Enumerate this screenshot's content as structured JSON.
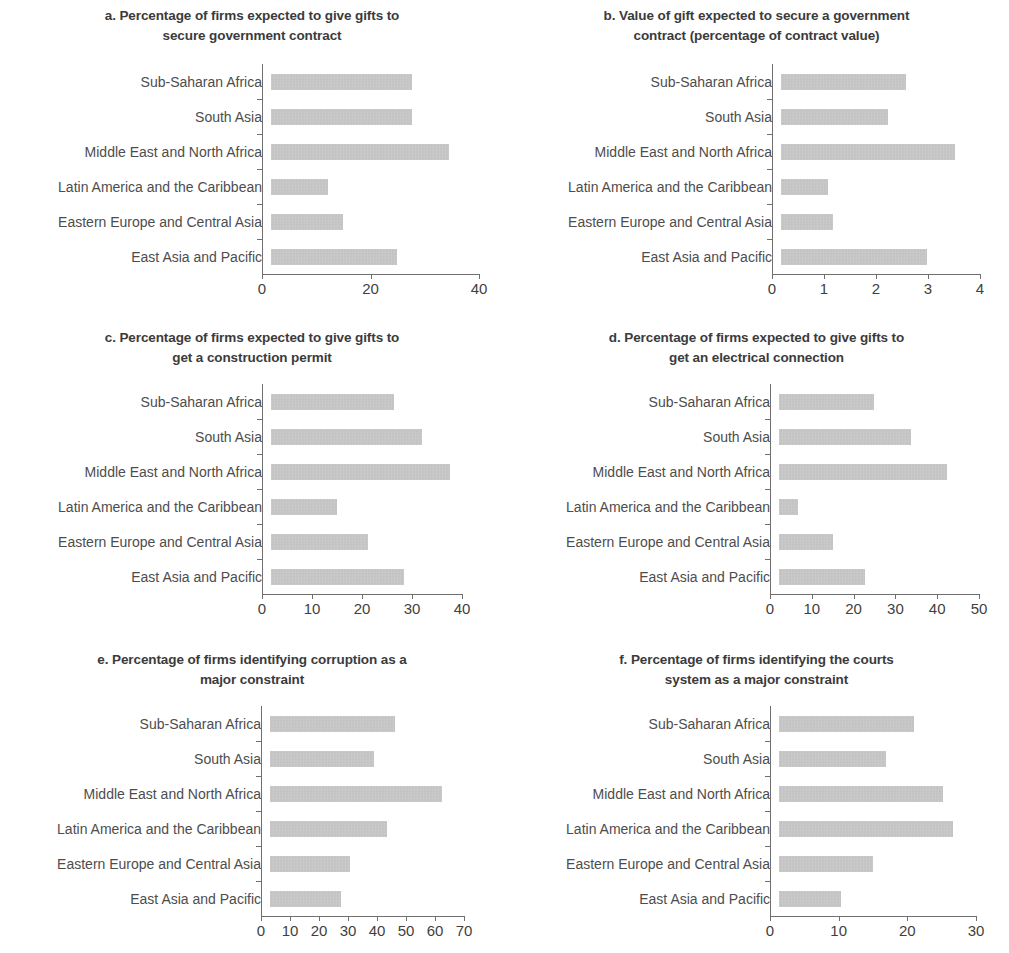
{
  "figure": {
    "categories": [
      "Sub-Saharan Africa",
      "South Asia",
      "Middle East and North Africa",
      "Latin America and the Caribbean",
      "Eastern Europe and Central Asia",
      "East Asia and Pacific"
    ],
    "bar_color": "#b9b9b9",
    "axis_color": "#6f6f6f",
    "title_color": "#3b3b3b",
    "label_color": "#4d4d4d"
  },
  "panels": [
    {
      "id": "a",
      "title": "a. Percentage of firms expected to give gifts to secure government contract",
      "title_lines": [
        "a. Percentage of firms expected to give gifts to",
        "secure government contract"
      ]
    },
    {
      "id": "b",
      "title": "b. Value of gift expected to secure a government contract (percentage of contract value)",
      "title_lines": [
        "b. Value of gift expected to secure a government",
        "contract (percentage of contract value)"
      ]
    },
    {
      "id": "c",
      "title": "c. Percentage of firms expected to give gifts to get a construction permit",
      "title_lines": [
        "c. Percentage of firms expected to give gifts to",
        "get a construction permit"
      ]
    },
    {
      "id": "d",
      "title": "d. Percentage of firms expected to give gifts to get an electrical connection",
      "title_lines": [
        "d. Percentage of firms expected to give gifts to",
        "get an electrical connection"
      ]
    },
    {
      "id": "e",
      "title": "e. Percentage of firms identifying corruption as a major constraint",
      "title_lines": [
        "e. Percentage of firms identifying corruption as a",
        "major constraint"
      ]
    },
    {
      "id": "f",
      "title": "f. Percentage of firms identifying the courts system as a major constraint",
      "title_lines": [
        "f. Percentage of firms identifying the courts",
        "system as a major constraint"
      ]
    }
  ],
  "chart_data": [
    {
      "panel": "a",
      "type": "bar",
      "orientation": "horizontal",
      "title": "a. Percentage of firms expected to give gifts to secure government contract",
      "xlabel": "",
      "ylabel": "",
      "categories": [
        "Sub-Saharan Africa",
        "South Asia",
        "Middle East and North Africa",
        "Latin America and the Caribbean",
        "Eastern Europe and Central Asia",
        "East Asia and Pacific"
      ],
      "values": [
        26.0,
        26.0,
        32.8,
        10.5,
        13.3,
        23.2
      ],
      "xlim": [
        0,
        40
      ],
      "xticks": [
        0,
        20,
        40
      ],
      "xticklabels": [
        "0",
        "20",
        "40"
      ],
      "grid": false,
      "legend": null
    },
    {
      "panel": "b",
      "type": "bar",
      "orientation": "horizontal",
      "title": "b. Value of gift expected to secure a government contract (percentage of contract value)",
      "xlabel": "",
      "ylabel": "",
      "categories": [
        "Sub-Saharan Africa",
        "South Asia",
        "Middle East and North Africa",
        "Latin America and the Caribbean",
        "Eastern Europe and Central Asia",
        "East Asia and Pacific"
      ],
      "values": [
        2.4,
        2.05,
        3.35,
        0.9,
        1.0,
        2.8
      ],
      "xlim": [
        0,
        4
      ],
      "xticks": [
        0,
        1,
        2,
        3,
        4
      ],
      "xticklabels": [
        "0",
        "1",
        "2",
        "3",
        "4"
      ],
      "grid": false,
      "legend": null
    },
    {
      "panel": "c",
      "type": "bar",
      "orientation": "horizontal",
      "title": "c. Percentage of firms expected to give gifts to get a construction permit",
      "xlabel": "",
      "ylabel": "",
      "categories": [
        "Sub-Saharan Africa",
        "South Asia",
        "Middle East and North Africa",
        "Latin America and the Caribbean",
        "Eastern Europe and Central Asia",
        "East Asia and Pacific"
      ],
      "values": [
        24.6,
        30.2,
        35.8,
        13.2,
        19.3,
        26.6
      ],
      "xlim": [
        0,
        40
      ],
      "xticks": [
        0,
        10,
        20,
        30,
        40
      ],
      "xticklabels": [
        "0",
        "10",
        "20",
        "30",
        "40"
      ],
      "grid": false,
      "legend": null
    },
    {
      "panel": "d",
      "type": "bar",
      "orientation": "horizontal",
      "title": "d. Percentage of firms expected to give gifts to get an electrical connection",
      "xlabel": "",
      "ylabel": "",
      "categories": [
        "Sub-Saharan Africa",
        "South Asia",
        "Middle East and North Africa",
        "Latin America and the Caribbean",
        "Eastern Europe and Central Asia",
        "East Asia and Pacific"
      ],
      "values": [
        22.8,
        31.6,
        40.2,
        4.6,
        13.0,
        20.6
      ],
      "xlim": [
        0,
        50
      ],
      "xticks": [
        0,
        10,
        20,
        30,
        40,
        50
      ],
      "xticklabels": [
        "0",
        "10",
        "20",
        "30",
        "40",
        "50"
      ],
      "grid": false,
      "legend": null
    },
    {
      "panel": "e",
      "type": "bar",
      "orientation": "horizontal",
      "title": "e. Percentage of firms identifying corruption as a major constraint",
      "xlabel": "",
      "ylabel": "",
      "categories": [
        "Sub-Saharan Africa",
        "South Asia",
        "Middle East and North Africa",
        "Latin America and the Caribbean",
        "Eastern Europe and Central Asia",
        "East Asia and Pacific"
      ],
      "values": [
        43.2,
        36.0,
        59.4,
        40.3,
        27.6,
        24.5
      ],
      "xlim": [
        0,
        70
      ],
      "xticks": [
        0,
        10,
        20,
        30,
        40,
        50,
        60,
        70
      ],
      "xticklabels": [
        "0",
        "10",
        "20",
        "30",
        "40",
        "50",
        "60",
        "70"
      ],
      "grid": false,
      "legend": null
    },
    {
      "panel": "f",
      "type": "bar",
      "orientation": "horizontal",
      "title": "f. Percentage of firms identifying the courts system as a major constraint",
      "xlabel": "",
      "ylabel": "",
      "categories": [
        "Sub-Saharan Africa",
        "South Asia",
        "Middle East and North Africa",
        "Latin America and the Caribbean",
        "Eastern Europe and Central Asia",
        "East Asia and Pacific"
      ],
      "values": [
        19.7,
        15.6,
        23.9,
        25.4,
        13.7,
        9.1
      ],
      "xlim": [
        0,
        30
      ],
      "xticks": [
        0,
        10,
        20,
        30
      ],
      "xticklabels": [
        "0",
        "10",
        "20",
        "30"
      ],
      "grid": false,
      "legend": null
    }
  ]
}
